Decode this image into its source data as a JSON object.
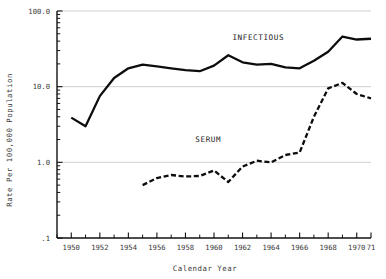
{
  "chart_data": {
    "type": "line",
    "title": "",
    "xlabel": "Calendar Year",
    "ylabel": "Rate Per 100,000 Population",
    "yscale": "log",
    "ylim": [
      0.1,
      100.0
    ],
    "xlim": [
      1949,
      1971
    ],
    "grid": true,
    "legend_position": "inline-annotation",
    "ytick_labels": [
      "100.0",
      "10.0",
      "1.0",
      ".1"
    ],
    "ytick_values": [
      100.0,
      10.0,
      1.0,
      0.1
    ],
    "xtick_labels": [
      "1950",
      "1952",
      "1954",
      "1956",
      "1958",
      "1960",
      "1962",
      "1964",
      "1966",
      "1968",
      "1970",
      "71"
    ],
    "xtick_values": [
      1950,
      1952,
      1954,
      1956,
      1958,
      1960,
      1962,
      1964,
      1966,
      1968,
      1970,
      1971
    ],
    "xtick_minor_values": [
      1949,
      1951,
      1953,
      1955,
      1957,
      1959,
      1961,
      1963,
      1965,
      1967,
      1969
    ],
    "series": [
      {
        "name": "INFECTIOUS",
        "label": "INFECTIOUS",
        "style": "solid",
        "color": "#0d0d0d",
        "x": [
          1950,
          1951,
          1952,
          1953,
          1954,
          1955,
          1956,
          1957,
          1958,
          1959,
          1960,
          1961,
          1962,
          1963,
          1964,
          1965,
          1966,
          1967,
          1968,
          1969,
          1970,
          1971
        ],
        "values": [
          3.9,
          3.0,
          7.5,
          13.0,
          17.5,
          19.5,
          18.5,
          17.5,
          16.5,
          16.0,
          19.0,
          26.0,
          21.0,
          19.5,
          20.0,
          18.0,
          17.5,
          22.0,
          29.0,
          46.0,
          42.0,
          43.0
        ]
      },
      {
        "name": "SERUM",
        "label": "SERUM",
        "style": "dashed",
        "color": "#0d0d0d",
        "x": [
          1955,
          1956,
          1957,
          1958,
          1959,
          1960,
          1961,
          1962,
          1963,
          1964,
          1965,
          1966,
          1967,
          1968,
          1969,
          1970,
          1971
        ],
        "values": [
          0.5,
          0.62,
          0.68,
          0.65,
          0.66,
          0.78,
          0.55,
          0.88,
          1.05,
          1.0,
          1.25,
          1.35,
          4.0,
          9.5,
          11.2,
          8.0,
          7.0
        ]
      }
    ],
    "annotations": [
      {
        "text": "INFECTIOUS",
        "x": 1963.1,
        "y": 42.0
      },
      {
        "text": "SERUM",
        "x": 1959.6,
        "y": 1.85
      }
    ]
  }
}
